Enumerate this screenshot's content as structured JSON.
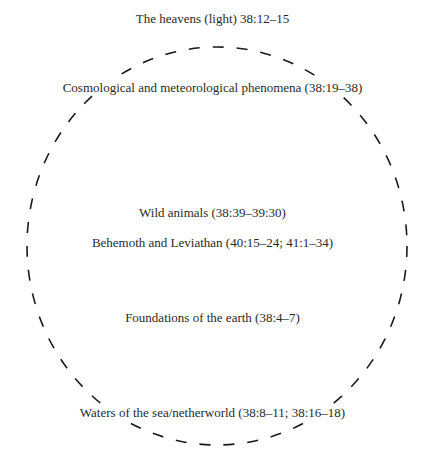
{
  "diagram": {
    "type": "concentric-cosmos-diagram",
    "boundary": {
      "shape": "dashed-circle",
      "stroke": "#1a1a1a",
      "cx": 217,
      "cy": 246,
      "rx": 190,
      "ry": 199
    },
    "labels": [
      {
        "id": "heavens",
        "text": "The heavens (light) 38:12–15",
        "top": 11
      },
      {
        "id": "cosmological",
        "text": "Cosmological and meteorological phenomena (38:19–38)",
        "top": 80
      },
      {
        "id": "wild-animals",
        "text": "Wild animals (38:39–39:30)",
        "top": 205
      },
      {
        "id": "behemoth-leviathan",
        "text": "Behemoth and Leviathan (40:15–24; 41:1–34)",
        "top": 235
      },
      {
        "id": "foundations",
        "text": "Foundations of the earth (38:4–7)",
        "top": 310
      },
      {
        "id": "waters",
        "text": "Waters of the sea/netherworld (38:8–11; 38:16–18)",
        "top": 405
      }
    ]
  }
}
